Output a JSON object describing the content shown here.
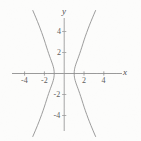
{
  "figure": {
    "width": 141,
    "height": 141,
    "background_color": "#fcfcfb",
    "curve_color": "#8a8a8a",
    "axis_color": "#8e8e8e",
    "text_color": "#5d5d5d"
  },
  "chart_data": {
    "type": "line",
    "title": "",
    "xlabel": "x",
    "ylabel": "y",
    "xlim": [
      -5.8,
      6.2
    ],
    "ylim": [
      -5.6,
      5.6
    ],
    "grid": false,
    "legend": null,
    "x_ticks": [
      -4,
      -2,
      2,
      4
    ],
    "x_tick_labels": [
      "-4",
      "-2",
      "2",
      "4"
    ],
    "y_ticks": [
      4,
      2,
      -2,
      -4
    ],
    "y_tick_labels": [
      "4",
      "2",
      "-2",
      "-4"
    ],
    "curve": {
      "name": "hyperbola",
      "equation": "x^2 - y^2/9 = 1",
      "orientation": "horizontal",
      "center": [
        0,
        0
      ],
      "vertices": [
        [
          -1,
          0
        ],
        [
          1,
          0
        ]
      ],
      "a": 1,
      "b": 3,
      "branches": [
        {
          "name": "left-branch",
          "points": [
            [
              -3.17,
              -6.0
            ],
            [
              -2.85,
              -5.3
            ],
            [
              -2.55,
              -4.6
            ],
            [
              -2.27,
              -3.9
            ],
            [
              -2.01,
              -3.2
            ],
            [
              -1.78,
              -2.5
            ],
            [
              -1.57,
              -1.9
            ],
            [
              -1.38,
              -1.4
            ],
            [
              -1.22,
              -1.0
            ],
            [
              -1.1,
              -0.65
            ],
            [
              -1.03,
              -0.36
            ],
            [
              -1.0,
              0.0
            ],
            [
              -1.03,
              0.36
            ],
            [
              -1.1,
              0.65
            ],
            [
              -1.22,
              1.0
            ],
            [
              -1.38,
              1.4
            ],
            [
              -1.57,
              1.9
            ],
            [
              -1.78,
              2.5
            ],
            [
              -2.01,
              3.2
            ],
            [
              -2.27,
              3.9
            ],
            [
              -2.55,
              4.6
            ],
            [
              -2.85,
              5.3
            ],
            [
              -3.17,
              6.0
            ]
          ]
        },
        {
          "name": "right-branch",
          "points": [
            [
              3.17,
              -6.0
            ],
            [
              2.85,
              -5.3
            ],
            [
              2.55,
              -4.6
            ],
            [
              2.27,
              -3.9
            ],
            [
              2.01,
              -3.2
            ],
            [
              1.78,
              -2.5
            ],
            [
              1.57,
              -1.9
            ],
            [
              1.38,
              -1.4
            ],
            [
              1.22,
              -1.0
            ],
            [
              1.1,
              -0.65
            ],
            [
              1.03,
              -0.36
            ],
            [
              1.0,
              0.0
            ],
            [
              1.03,
              0.36
            ],
            [
              1.1,
              0.65
            ],
            [
              1.22,
              1.0
            ],
            [
              1.38,
              1.4
            ],
            [
              1.57,
              1.9
            ],
            [
              1.78,
              2.5
            ],
            [
              2.01,
              3.2
            ],
            [
              2.27,
              3.9
            ],
            [
              2.55,
              4.6
            ],
            [
              2.85,
              5.3
            ],
            [
              3.17,
              6.0
            ]
          ]
        }
      ]
    },
    "axes": {
      "x_axis_label": "x",
      "y_axis_label": "y"
    }
  },
  "labels": {
    "x_neg4": "-4",
    "x_neg2": "-2",
    "x_pos2": "2",
    "x_pos4": "4",
    "y_pos4": "4",
    "y_pos2": "2",
    "y_neg2": "-2",
    "y_neg4": "-4",
    "axis_x": "x",
    "axis_y": "y"
  }
}
